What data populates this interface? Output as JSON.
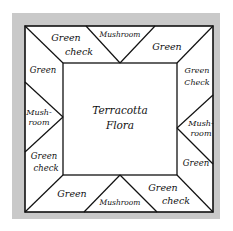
{
  "colors": {
    "frame": "#c9c9c9",
    "background": "#ffffff",
    "line": "#111111"
  },
  "center": {
    "line1": "Terracotta",
    "line2": "Flora"
  },
  "top": {
    "left": {
      "line1": "Green",
      "line2": "check"
    },
    "middle": {
      "line1": "Mushroom"
    },
    "right": {
      "line1": "Green"
    }
  },
  "left": {
    "top": {
      "line1": "Green"
    },
    "middle": {
      "line1": "Mush-",
      "line2": "room"
    },
    "bottom": {
      "line1": "Green",
      "line2": "check"
    }
  },
  "right": {
    "top": {
      "line1": "Green",
      "line2": "Check"
    },
    "middle": {
      "line1": "Mush-",
      "line2": "room"
    },
    "bottom": {
      "line1": "Green"
    }
  },
  "bottom": {
    "left": {
      "line1": "Green"
    },
    "middle": {
      "line1": "Mushroom"
    },
    "right": {
      "line1": "Green",
      "line2": "check"
    }
  }
}
